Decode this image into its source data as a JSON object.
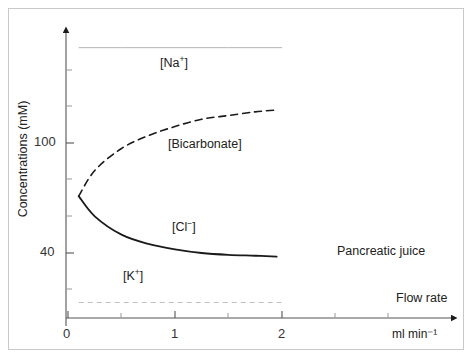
{
  "chart_data": {
    "type": "line",
    "title": "",
    "subtitle": "",
    "xlabel": "ml min⁻¹",
    "ylabel": "Concentrations (mM)",
    "xlim": [
      0,
      2.65
    ],
    "ylim": [
      0,
      178
    ],
    "grid": false,
    "legend_position": "inline-annotations",
    "x_ticks": [
      {
        "value": 0,
        "label": "0"
      },
      {
        "value": 1,
        "label": "1"
      },
      {
        "value": 2,
        "label": "2"
      }
    ],
    "x_minor_ticks": [
      0.5,
      1.5,
      2.5
    ],
    "y_ticks": [
      {
        "value": 100,
        "label": "100"
      },
      {
        "value": 40,
        "label": "40"
      }
    ],
    "y_minor_ticks": [
      20,
      60,
      80,
      120,
      140,
      160
    ],
    "annotations": [
      {
        "name": "pancreatic-juice",
        "text": "Pancreatic juice"
      },
      {
        "name": "flow-rate",
        "text": "Flow rate"
      }
    ],
    "series": [
      {
        "name": "[Na+]",
        "label": "[Na",
        "label_sup": "+",
        "label_end": "]",
        "style": "solid",
        "color": "#b4b4b4",
        "width": 1,
        "x": [
          0.1,
          0.5,
          1.0,
          1.5,
          2.0
        ],
        "values": [
          152,
          152,
          152,
          152,
          152
        ]
      },
      {
        "name": "[Bicarbonate]",
        "label": "[Bicarbonate]",
        "style": "dashed",
        "color": "#1a1a1a",
        "width": 1.6,
        "x": [
          0.1,
          0.25,
          0.5,
          0.75,
          1.0,
          1.25,
          1.5,
          1.75,
          1.95
        ],
        "values": [
          71,
          85,
          97,
          104,
          109,
          113,
          115,
          117,
          118
        ]
      },
      {
        "name": "[Cl-]",
        "label": "[Cl",
        "label_sup": "−",
        "label_end": "]",
        "style": "solid",
        "color": "#1a1a1a",
        "width": 1.8,
        "x": [
          0.1,
          0.25,
          0.5,
          0.75,
          1.0,
          1.25,
          1.5,
          1.75,
          1.95
        ],
        "values": [
          71,
          60,
          50,
          45,
          42,
          40,
          39,
          38.5,
          38
        ]
      },
      {
        "name": "[K+]",
        "label": "[K",
        "label_sup": "+",
        "label_end": "]",
        "style": "dashed",
        "color": "#c0c0c0",
        "width": 1,
        "x": [
          0.1,
          0.5,
          1.0,
          1.5,
          2.0
        ],
        "values": [
          13,
          13,
          13,
          13,
          13
        ]
      }
    ]
  }
}
